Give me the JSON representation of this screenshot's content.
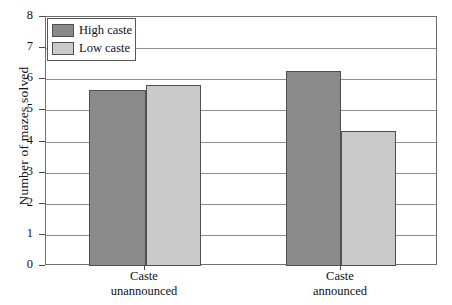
{
  "chart_data": {
    "type": "bar",
    "title": "",
    "xlabel": "",
    "ylabel": "Number of mazes solved",
    "ylim": [
      0,
      8
    ],
    "yticks": [
      "0",
      "1",
      "2",
      "3",
      "4",
      "5",
      "6",
      "7",
      "8"
    ],
    "grid": true,
    "legend_position": "top-left",
    "categories": [
      "Caste unannounced",
      "Caste announced"
    ],
    "category_lines": [
      [
        "Caste",
        "unannounced"
      ],
      [
        "Caste",
        "announced"
      ]
    ],
    "series": [
      {
        "name": "High caste",
        "color": "#8a8a8a",
        "values": [
          5.65,
          6.25
        ]
      },
      {
        "name": "Low caste",
        "color": "#c9c9c9",
        "values": [
          5.8,
          4.35
        ]
      }
    ]
  },
  "legend": {
    "items": [
      {
        "label": "High caste",
        "color": "#8a8a8a"
      },
      {
        "label": "Low caste",
        "color": "#c9c9c9"
      }
    ]
  },
  "colors": {
    "high_caste": "#8a8a8a",
    "low_caste": "#c9c9c9",
    "frame": "#6e6e6e",
    "gridline": "#8e8e8e",
    "bar_outline": "#4f4f4f",
    "text": "#111111"
  }
}
